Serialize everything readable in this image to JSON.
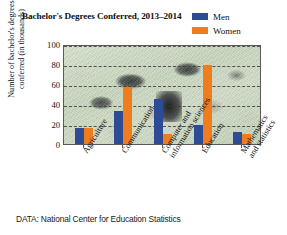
{
  "chart_data": {
    "type": "bar",
    "title": "Bachelor's Degrees Conferred, 2013–2014",
    "xlabel": "",
    "ylabel": "Number of bachelor's degrees conferred (in thousands)",
    "ylim": [
      0,
      100
    ],
    "yticks": [
      100,
      80,
      60,
      40,
      20,
      0
    ],
    "grid": true,
    "legend_position": "top-right",
    "categories": [
      "Agriculture",
      "Communication",
      "Computer and information sciences",
      "Education",
      "Mathematics and statistics"
    ],
    "series": [
      {
        "name": "Men",
        "color": "#2e4b96",
        "values": [
          16,
          33,
          45,
          19,
          12
        ]
      },
      {
        "name": "Women",
        "color": "#ef7d1e",
        "values": [
          16,
          57,
          10,
          79,
          10
        ]
      }
    ],
    "source": "DATA: National Center for Education Statistics"
  },
  "title": {
    "text": "Bachelor's Degrees Conferred, 2013–2014"
  },
  "legend": {
    "items": [
      {
        "label": "Men",
        "color": "#2e4b96"
      },
      {
        "label": "Women",
        "color": "#ef7d1e"
      }
    ]
  },
  "axes": {
    "y_title_line1": "Number of bachelor's degrees",
    "y_title_line2": "conferred (in thousands)",
    "y_ticks": [
      "100",
      "80",
      "60",
      "40",
      "20",
      "0"
    ],
    "x_labels": [
      "Agriculture",
      "Communication",
      "Computer and information sciences",
      "Education",
      "Mathematics and statistics"
    ],
    "x_labels_display": [
      {
        "line1": "Agriculture",
        "line2": ""
      },
      {
        "line1": "Communication",
        "line2": ""
      },
      {
        "line1": "Computer and",
        "line2": "information sciences"
      },
      {
        "line1": "Education",
        "line2": ""
      },
      {
        "line1": "Mathematics",
        "line2": "and statistics"
      }
    ]
  },
  "source": {
    "text": "DATA: National Center for Education Statistics"
  }
}
